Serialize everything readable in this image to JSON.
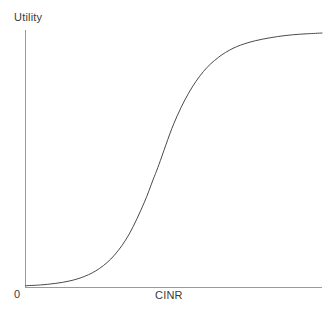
{
  "chart_data": {
    "type": "line",
    "title": "",
    "subtitle": "",
    "xlabel": "CINR",
    "ylabel": "Utility",
    "origin_label": "0",
    "grid": false,
    "legend": false,
    "legend_position": "none",
    "xlim": [
      0,
      1
    ],
    "ylim": [
      0,
      1
    ],
    "xticks": [],
    "yticks": [],
    "xticklabels": [],
    "yticklabels": [],
    "annotations": [],
    "series": [
      {
        "name": "Utility",
        "color": "#4a4a4a",
        "linewidth": 1,
        "x": [
          0.0,
          0.05,
          0.1,
          0.15,
          0.2,
          0.25,
          0.3,
          0.35,
          0.4,
          0.43,
          0.45,
          0.5,
          0.55,
          0.6,
          0.65,
          0.7,
          0.75,
          0.8,
          0.85,
          0.9,
          0.95,
          1.0
        ],
        "y": [
          0.005,
          0.008,
          0.014,
          0.024,
          0.042,
          0.073,
          0.125,
          0.208,
          0.33,
          0.42,
          0.48,
          0.64,
          0.76,
          0.845,
          0.9,
          0.936,
          0.958,
          0.972,
          0.982,
          0.989,
          0.993,
          0.996
        ]
      }
    ]
  },
  "axes": {
    "y_axis_color": "#9a9a9a",
    "x_axis_color": "#9a9a9a",
    "curve_color": "#4a4a4a",
    "background_color": "#ffffff",
    "text_color": "#3a3a3a"
  }
}
